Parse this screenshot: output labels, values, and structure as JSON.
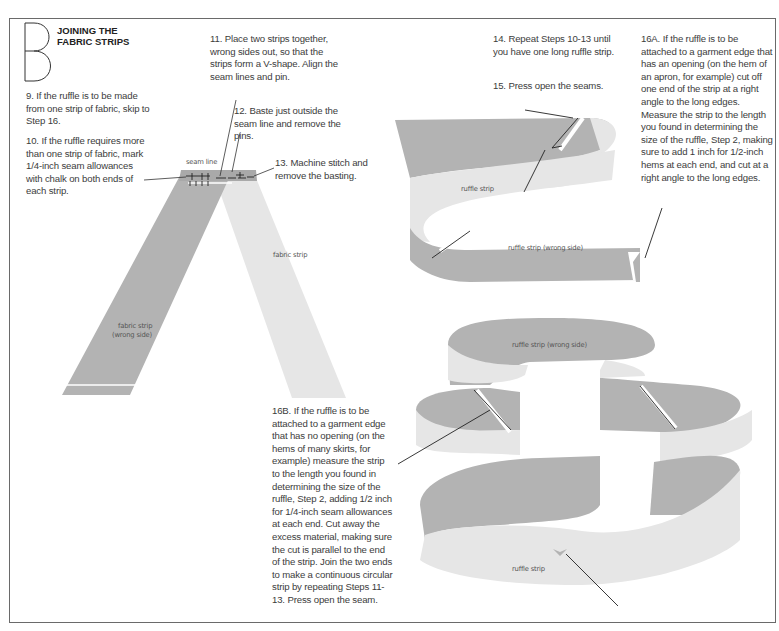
{
  "section": {
    "letter": "B",
    "title_line1": "JOINING THE",
    "title_line2": "FABRIC STRIPS"
  },
  "steps": {
    "s9": "9. If the ruffle is to be made from one strip of fabric, skip to Step 16.",
    "s10": "10. If the ruffle requires more than one strip of fabric, mark 1/4-inch seam allowances with chalk on both ends of each strip.",
    "s11": "11. Place two strips together, wrong sides out, so that the strips form a V-shape. Align the seam lines and pin.",
    "s12": "12. Baste just outside the seam line and remove the pins.",
    "s13": "13. Machine stitch and remove the basting.",
    "s14": "14. Repeat Steps 10-13 until you have one long ruffle strip.",
    "s15": "15. Press open the seams.",
    "s16a": "16A. If the ruffle is to be attached to a garment edge that has an opening (on the hem of an apron, for example) cut off one end of the strip at a right angle to the long edges. Measure the strip to the length you found in determining the size of the ruffle, Step 2, making sure to add 1 inch for 1/2-inch hems at each end, and cut at a right angle to the long edges.",
    "s16b": "16B. If the ruffle is to be attached to a garment edge that has no opening (on the hems of many skirts, for example) measure the strip to the length you found in determining the size of the ruffle, Step 2, adding 1/2 inch for 1/4-inch seam allowances at each end. Cut away the excess material, making sure the cut is parallel to the end of the strip. Join the two ends to make a continuous circular strip by repeating Steps 11-13. Press open the seam."
  },
  "labels": {
    "seam_line": "seam line",
    "fabric_strip": "fabric strip",
    "fabric_strip_wrong_1": "fabric strip",
    "fabric_strip_wrong_2": "(wrong side)",
    "ruffle_strip_1": "ruffle strip",
    "ruffle_strip_wrong_1": "ruffle strip (wrong side)",
    "ruffle_strip_wrong_2": "ruffle strip (wrong side)",
    "ruffle_strip_2": "ruffle strip"
  },
  "colors": {
    "dark_fabric": "#b3b3b3",
    "light_fabric": "#e6e6e6",
    "line": "#2a2a2a",
    "border": "#6a6a6a"
  }
}
